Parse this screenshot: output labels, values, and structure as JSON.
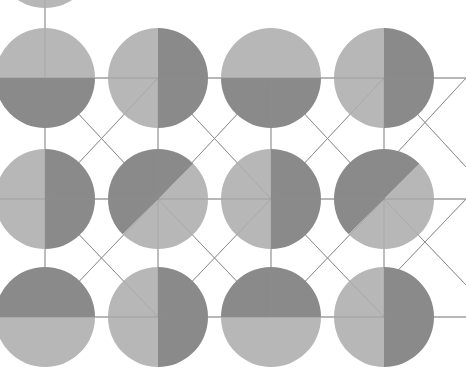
{
  "figure": {
    "width": 466,
    "height": 386,
    "background_color": "#ffffff"
  },
  "palette": {
    "light_gray": "#b7b7b7",
    "dark_gray": "#8a8a8a",
    "bond_line": "#8f8f8f",
    "background": "#ffffff"
  },
  "geometry": {
    "radius": 50,
    "column_x": [
      45,
      158,
      271,
      384
    ],
    "row_y": [
      78,
      199,
      317
    ],
    "bond_width": 1
  },
  "atoms": [
    {
      "id": "atom-r0-c0",
      "row": 0,
      "col": 0,
      "cx": 45,
      "cy": 78,
      "r": 50,
      "split": "horizontal",
      "first_half": "dark",
      "second_half": "light",
      "angle": 0
    },
    {
      "id": "atom-r0-c1",
      "row": 0,
      "col": 1,
      "cx": 158,
      "cy": 78,
      "r": 50,
      "split": "vertical",
      "first_half": "light",
      "second_half": "dark",
      "angle": 90
    },
    {
      "id": "atom-r0-c2",
      "row": 0,
      "col": 2,
      "cx": 271,
      "cy": 78,
      "r": 50,
      "split": "horizontal",
      "first_half": "dark",
      "second_half": "light",
      "angle": 0
    },
    {
      "id": "atom-r0-c3",
      "row": 0,
      "col": 3,
      "cx": 384,
      "cy": 78,
      "r": 50,
      "split": "vertical",
      "first_half": "light",
      "second_half": "dark",
      "angle": 90
    },
    {
      "id": "atom-r1-c0",
      "row": 1,
      "col": 0,
      "cx": 45,
      "cy": 199,
      "r": 50,
      "split": "vertical",
      "first_half": "light",
      "second_half": "dark",
      "angle": 90
    },
    {
      "id": "atom-r1-c1",
      "row": 1,
      "col": 1,
      "cx": 158,
      "cy": 199,
      "r": 50,
      "split": "diagonal",
      "first_half": "light",
      "second_half": "dark",
      "angle": 45
    },
    {
      "id": "atom-r1-c2",
      "row": 1,
      "col": 2,
      "cx": 271,
      "cy": 199,
      "r": 50,
      "split": "vertical",
      "first_half": "light",
      "second_half": "dark",
      "angle": 90
    },
    {
      "id": "atom-r1-c3",
      "row": 1,
      "col": 3,
      "cx": 384,
      "cy": 199,
      "r": 50,
      "split": "diagonal",
      "first_half": "light",
      "second_half": "dark",
      "angle": 45
    },
    {
      "id": "atom-r2-c0",
      "row": 2,
      "col": 0,
      "cx": 45,
      "cy": 317,
      "r": 50,
      "split": "horizontal",
      "first_half": "light",
      "second_half": "dark",
      "angle": 0
    },
    {
      "id": "atom-r2-c1",
      "row": 2,
      "col": 1,
      "cx": 158,
      "cy": 317,
      "r": 50,
      "split": "vertical",
      "first_half": "light",
      "second_half": "dark",
      "angle": 90
    },
    {
      "id": "atom-r2-c2",
      "row": 2,
      "col": 2,
      "cx": 271,
      "cy": 317,
      "r": 50,
      "split": "horizontal",
      "first_half": "light",
      "second_half": "dark",
      "angle": 0
    },
    {
      "id": "atom-r2-c3",
      "row": 2,
      "col": 3,
      "cx": 384,
      "cy": 317,
      "r": 50,
      "split": "vertical",
      "first_half": "light",
      "second_half": "dark",
      "angle": 90
    }
  ],
  "partial_atoms": [
    {
      "id": "atom-top-partial",
      "cx": 45,
      "cy": -42,
      "r": 50,
      "split": "none",
      "first_half": "light",
      "second_half": "light",
      "angle": 0
    }
  ],
  "bonds": [
    {
      "id": "bond-h-r0-0",
      "type": "horizontal",
      "x1": 0,
      "y1": 78,
      "x2": 466,
      "y2": 78
    },
    {
      "id": "bond-h-r1-0",
      "type": "horizontal",
      "x1": 0,
      "y1": 199,
      "x2": 466,
      "y2": 199
    },
    {
      "id": "bond-h-r2-0",
      "type": "horizontal",
      "x1": 0,
      "y1": 317,
      "x2": 466,
      "y2": 317
    },
    {
      "id": "bond-v-c0-r0r1",
      "type": "vertical",
      "x1": 45,
      "y1": 78,
      "x2": 45,
      "y2": 199
    },
    {
      "id": "bond-v-c1-r0r1",
      "type": "vertical",
      "x1": 158,
      "y1": 78,
      "x2": 158,
      "y2": 199
    },
    {
      "id": "bond-v-c2-r0r1",
      "type": "vertical",
      "x1": 271,
      "y1": 78,
      "x2": 271,
      "y2": 199
    },
    {
      "id": "bond-v-c3-r0r1",
      "type": "vertical",
      "x1": 384,
      "y1": 78,
      "x2": 384,
      "y2": 199
    },
    {
      "id": "bond-v-c0-r1r2",
      "type": "vertical",
      "x1": 45,
      "y1": 199,
      "x2": 45,
      "y2": 317
    },
    {
      "id": "bond-v-c1-r1r2",
      "type": "vertical",
      "x1": 158,
      "y1": 199,
      "x2": 158,
      "y2": 317
    },
    {
      "id": "bond-v-c2-r1r2",
      "type": "vertical",
      "x1": 271,
      "y1": 199,
      "x2": 271,
      "y2": 317
    },
    {
      "id": "bond-v-c3-r1r2",
      "type": "vertical",
      "x1": 384,
      "y1": 199,
      "x2": 384,
      "y2": 317
    },
    {
      "id": "bond-v-c0-top",
      "type": "vertical",
      "x1": 45,
      "y1": 0,
      "x2": 45,
      "y2": 78
    },
    {
      "id": "bond-d-r0r1-a0",
      "type": "diagonal",
      "x1": 45,
      "y1": 78,
      "x2": 158,
      "y2": 199
    },
    {
      "id": "bond-d-r0r1-a1",
      "type": "diagonal",
      "x1": 158,
      "y1": 78,
      "x2": 271,
      "y2": 199
    },
    {
      "id": "bond-d-r0r1-a2",
      "type": "diagonal",
      "x1": 271,
      "y1": 78,
      "x2": 384,
      "y2": 199
    },
    {
      "id": "bond-d-r0r1-a3",
      "type": "diagonal",
      "x1": 384,
      "y1": 78,
      "x2": 466,
      "y2": 167
    },
    {
      "id": "bond-d-r0r1-b0",
      "type": "diagonal",
      "x1": 158,
      "y1": 78,
      "x2": 45,
      "y2": 199
    },
    {
      "id": "bond-d-r0r1-b1",
      "type": "diagonal",
      "x1": 271,
      "y1": 78,
      "x2": 158,
      "y2": 199
    },
    {
      "id": "bond-d-r0r1-b2",
      "type": "diagonal",
      "x1": 384,
      "y1": 78,
      "x2": 271,
      "y2": 199
    },
    {
      "id": "bond-d-r0r1-b3",
      "type": "diagonal",
      "x1": 466,
      "y1": 78,
      "x2": 384,
      "y2": 167
    },
    {
      "id": "bond-d-r1r2-a0",
      "type": "diagonal",
      "x1": 45,
      "y1": 199,
      "x2": 158,
      "y2": 317
    },
    {
      "id": "bond-d-r1r2-a1",
      "type": "diagonal",
      "x1": 158,
      "y1": 199,
      "x2": 271,
      "y2": 317
    },
    {
      "id": "bond-d-r1r2-a2",
      "type": "diagonal",
      "x1": 271,
      "y1": 199,
      "x2": 384,
      "y2": 317
    },
    {
      "id": "bond-d-r1r2-a3",
      "type": "diagonal",
      "x1": 384,
      "y1": 199,
      "x2": 466,
      "y2": 285
    },
    {
      "id": "bond-d-r1r2-b0",
      "type": "diagonal",
      "x1": 158,
      "y1": 199,
      "x2": 45,
      "y2": 317
    },
    {
      "id": "bond-d-r1r2-b1",
      "type": "diagonal",
      "x1": 271,
      "y1": 199,
      "x2": 158,
      "y2": 317
    },
    {
      "id": "bond-d-r1r2-b2",
      "type": "diagonal",
      "x1": 384,
      "y1": 199,
      "x2": 271,
      "y2": 317
    },
    {
      "id": "bond-d-r1r2-b3",
      "type": "diagonal",
      "x1": 466,
      "y1": 199,
      "x2": 384,
      "y2": 285
    }
  ]
}
